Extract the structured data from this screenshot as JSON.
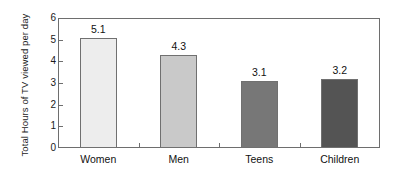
{
  "chart_data": {
    "type": "bar",
    "title": "",
    "xlabel": "",
    "ylabel": "Total Hours of TV viewed per day",
    "categories": [
      "Women",
      "Men",
      "Teens",
      "Children"
    ],
    "values": [
      5.1,
      4.3,
      3.1,
      3.2
    ],
    "value_labels": [
      "5.1",
      "4.3",
      "3.1",
      "3.2"
    ],
    "ylim": [
      0,
      6
    ],
    "yticks": [
      0,
      1,
      2,
      3,
      4,
      5,
      6
    ],
    "ytick_labels": [
      "0",
      "1",
      "2",
      "3",
      "4",
      "5",
      "6"
    ],
    "grid": false,
    "legend": false,
    "bar_colors": [
      "#ededed",
      "#c9c9c9",
      "#777777",
      "#545454"
    ],
    "bar_border_color": "#707070",
    "axis_color": "#6e6e6e",
    "text_color": "#111111",
    "background": "#ffffff"
  }
}
